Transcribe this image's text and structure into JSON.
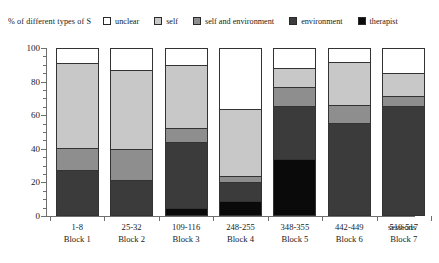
{
  "axis_title_y": "% of different types of S",
  "axis_title_x": "sessions",
  "legend": [
    {
      "label": "unclear",
      "color": "#ffffff",
      "icon": "legend-swatch-unclear"
    },
    {
      "label": "self",
      "color": "#c8c8c8",
      "icon": "legend-swatch-self"
    },
    {
      "label": "self and environment",
      "color": "#8e8e8e",
      "icon": "legend-swatch-self-and-environment"
    },
    {
      "label": "environment",
      "color": "#3b3b3b",
      "icon": "legend-swatch-environment"
    },
    {
      "label": "therapist",
      "color": "#0a0a0a",
      "icon": "legend-swatch-therapist"
    }
  ],
  "ytick_labels": [
    "0",
    "20",
    "40",
    "60",
    "80",
    "100"
  ],
  "xtick_labels": [
    {
      "sessions": "1-8",
      "block": "Block 1"
    },
    {
      "sessions": "25-32",
      "block": "Block 2"
    },
    {
      "sessions": "109-116",
      "block": "Block 3"
    },
    {
      "sessions": "248-255",
      "block": "Block 4"
    },
    {
      "sessions": "348-355",
      "block": "Block 5"
    },
    {
      "sessions": "442-449",
      "block": "Block 6"
    },
    {
      "sessions": "510-517",
      "block": "Block 7"
    }
  ],
  "chart_data": {
    "type": "bar",
    "subtype": "stacked-100-percent",
    "title": "",
    "xlabel": "sessions",
    "ylabel": "% of different types of S",
    "ylim": [
      0,
      100
    ],
    "ytick_values": [
      0,
      20,
      40,
      60,
      80,
      100
    ],
    "minor_ticks": true,
    "grid": false,
    "legend_position": "top",
    "categories": [
      "1-8 Block 1",
      "25-32 Block 2",
      "109-116 Block 3",
      "248-255 Block 4",
      "348-355 Block 5",
      "442-449 Block 6",
      "510-517 Block 7"
    ],
    "series": [
      {
        "name": "unclear",
        "color": "#ffffff",
        "values": [
          8.5,
          13,
          10,
          37,
          12,
          8,
          15
        ]
      },
      {
        "name": "self",
        "color": "#c8c8c8",
        "values": [
          51.5,
          48,
          38,
          41,
          11,
          26,
          13
        ]
      },
      {
        "name": "self and environment",
        "color": "#8e8e8e",
        "values": [
          13,
          18,
          8,
          3,
          11,
          10,
          6
        ]
      },
      {
        "name": "environment",
        "color": "#3b3b3b",
        "values": [
          27,
          21,
          40,
          11,
          32,
          56,
          66
        ]
      },
      {
        "name": "therapist",
        "color": "#0a0a0a",
        "values": [
          0,
          0,
          4,
          8,
          34,
          0,
          0
        ]
      }
    ]
  }
}
